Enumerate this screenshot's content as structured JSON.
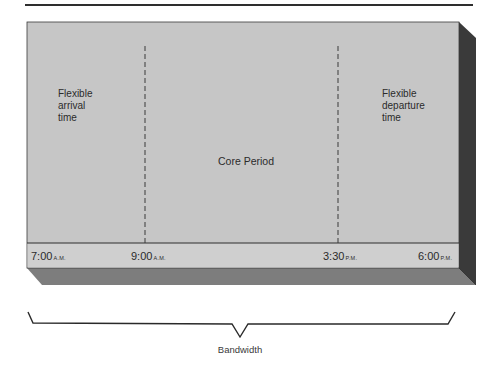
{
  "diagram": {
    "title_rule": true,
    "regions": [
      {
        "id": "arrival",
        "label_lines": [
          "Flexible",
          "arrival",
          "time"
        ]
      },
      {
        "id": "core",
        "label": "Core Period"
      },
      {
        "id": "departure",
        "label_lines": [
          "Flexible",
          "departure",
          "time"
        ]
      }
    ],
    "times": [
      {
        "value": "7:00",
        "suffix": "A.M."
      },
      {
        "value": "9:00",
        "suffix": "A.M."
      },
      {
        "value": "3:30",
        "suffix": "P.M."
      },
      {
        "value": "6:00",
        "suffix": "P.M."
      }
    ],
    "brace_label": "Bandwidth",
    "colors": {
      "front_face": "#c4c4c4",
      "side_face": "#3a3a3a",
      "bottom_face": "#7a7a7a",
      "timeline_strip": "#cdcdcd",
      "line": "#2e2e2e"
    }
  }
}
